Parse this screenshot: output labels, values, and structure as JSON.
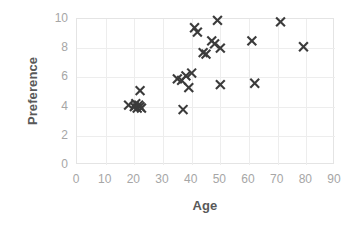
{
  "chart_data": {
    "type": "scatter",
    "title": "",
    "xlabel": "Age",
    "ylabel": "Preference",
    "xlim": [
      0,
      90
    ],
    "ylim": [
      0,
      10
    ],
    "xticks": [
      0,
      10,
      20,
      30,
      40,
      50,
      60,
      70,
      80,
      90
    ],
    "yticks": [
      0,
      2,
      4,
      6,
      8,
      10
    ],
    "grid": true,
    "legend": "none",
    "marker": "x",
    "marker_color": "#3b3b3b",
    "grid_color": "#ededed",
    "tick_label_color": "#a6a6a6",
    "axis_title_color": "#595959",
    "background": "#ffffff",
    "series": [
      {
        "name": "Age vs Preference",
        "points": [
          {
            "x": 18,
            "y": 4.1
          },
          {
            "x": 20,
            "y": 4.0
          },
          {
            "x": 20.5,
            "y": 4.2
          },
          {
            "x": 21,
            "y": 3.9
          },
          {
            "x": 21.5,
            "y": 4.1
          },
          {
            "x": 22,
            "y": 4.0
          },
          {
            "x": 22,
            "y": 5.1
          },
          {
            "x": 22.5,
            "y": 3.9
          },
          {
            "x": 35,
            "y": 5.9
          },
          {
            "x": 36.5,
            "y": 5.8
          },
          {
            "x": 37,
            "y": 3.8
          },
          {
            "x": 38,
            "y": 6.1
          },
          {
            "x": 39,
            "y": 5.3
          },
          {
            "x": 40,
            "y": 6.3
          },
          {
            "x": 41,
            "y": 9.4
          },
          {
            "x": 42,
            "y": 9.1
          },
          {
            "x": 44,
            "y": 7.7
          },
          {
            "x": 45,
            "y": 7.6
          },
          {
            "x": 47,
            "y": 8.5
          },
          {
            "x": 48,
            "y": 8.3
          },
          {
            "x": 49,
            "y": 9.9
          },
          {
            "x": 50,
            "y": 8.0
          },
          {
            "x": 50,
            "y": 5.5
          },
          {
            "x": 61,
            "y": 8.5
          },
          {
            "x": 62,
            "y": 5.6
          },
          {
            "x": 71,
            "y": 9.8
          },
          {
            "x": 79,
            "y": 8.1
          }
        ]
      }
    ]
  }
}
